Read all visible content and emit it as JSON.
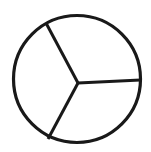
{
  "figure": {
    "background_color": "#ffffff",
    "stroke_color": "#191919",
    "fill_color": "none",
    "canvas": {
      "width": 151,
      "height": 152
    }
  },
  "shapes": {
    "circle": {
      "name": "outer-circle",
      "center_x": 77,
      "center_y": 79,
      "radius": 63.5,
      "stroke_width": 3.2
    },
    "vertex": {
      "name": "center-vertex",
      "x": 78,
      "y": 83
    },
    "radii": [
      {
        "name": "radius-right",
        "label": "East radius",
        "angle_deg": 0,
        "x1": 78,
        "y1": 83,
        "x2": 140.5,
        "y2": 80,
        "stroke_width": 3.0
      },
      {
        "name": "radius-upper-left",
        "label": "Upper-left radius",
        "angle_deg": 118,
        "x1": 78,
        "y1": 83,
        "x2": 46,
        "y2": 23,
        "stroke_width": 3.0
      },
      {
        "name": "radius-lower-left",
        "label": "Lower-left radius",
        "angle_deg": 242,
        "x1": 78,
        "y1": 83,
        "x2": 48,
        "y2": 139,
        "stroke_width": 3.0
      }
    ],
    "sectors": [
      {
        "name": "sector-top",
        "label": "Top third",
        "fraction": "1/3"
      },
      {
        "name": "sector-left",
        "label": "Left third",
        "fraction": "1/3"
      },
      {
        "name": "sector-bottom-right",
        "label": "Bottom-right third",
        "fraction": "1/3"
      }
    ]
  },
  "labels": {
    "caption": ""
  }
}
